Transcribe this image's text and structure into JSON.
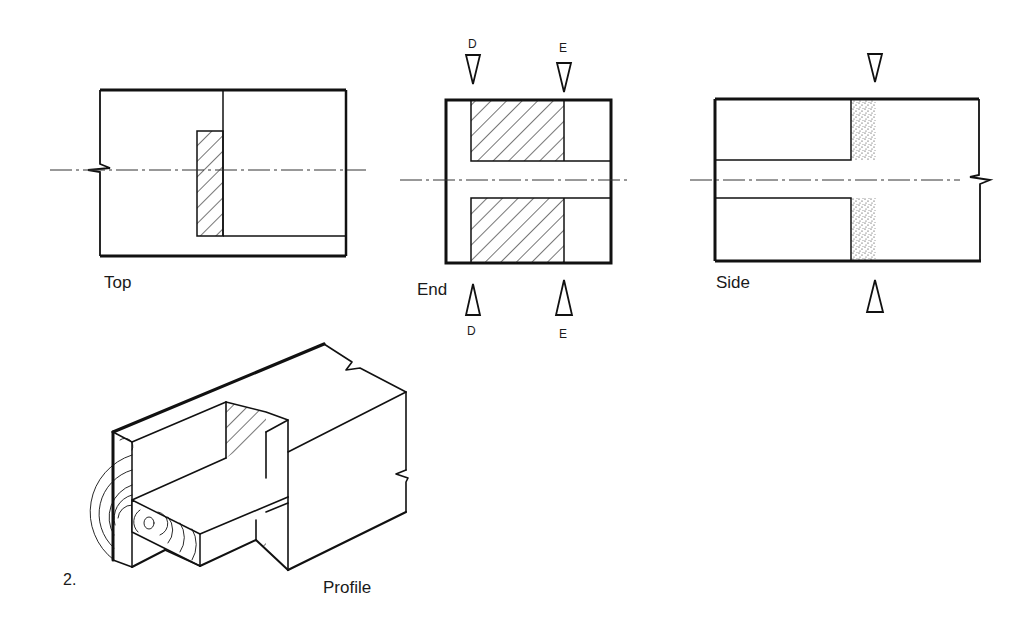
{
  "figure": {
    "number": "2.",
    "views": {
      "top": {
        "label": "Top"
      },
      "end": {
        "label": "End",
        "section_marks": {
          "d_top": "D",
          "e_top": "E",
          "d_bottom": "D",
          "e_bottom": "E"
        }
      },
      "side": {
        "label": "Side"
      },
      "profile": {
        "label": "Profile"
      }
    }
  }
}
